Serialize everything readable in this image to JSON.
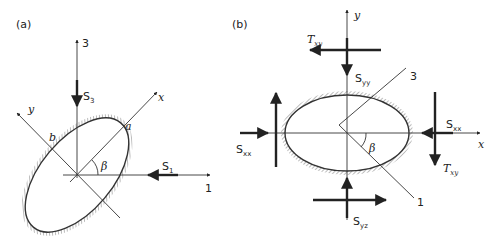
{
  "panels": [
    {
      "id": "a",
      "label": "(a)",
      "axes": {
        "vertical": "3",
        "horizontal": "1",
        "rotated_x": "x",
        "rotated_y": "y"
      },
      "stresses": {
        "vertical": "S",
        "vertical_sub": "3",
        "horizontal": "S",
        "horizontal_sub": "1"
      },
      "semi_axes": {
        "major": "a",
        "minor": "b"
      },
      "angle": "β"
    },
    {
      "id": "b",
      "label": "(b)",
      "axes": {
        "x": "x",
        "y": "y",
        "principal_3": "3",
        "principal_1": "1"
      },
      "stresses": {
        "top_shear": "T",
        "top_shear_sub": "xy",
        "top_normal": "S",
        "top_normal_sub": "yy",
        "left_normal": "S",
        "left_normal_sub": "xx",
        "right_normal": "S",
        "right_normal_sub": "xx",
        "right_shear": "T",
        "right_shear_sub": "xy",
        "bottom_normal": "S",
        "bottom_normal_sub": "yz"
      },
      "angle": "β"
    }
  ]
}
